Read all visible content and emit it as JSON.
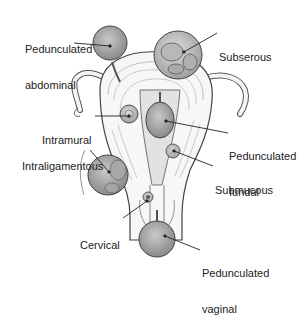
{
  "diagram": {
    "labels": [
      {
        "id": "pedunculated_abdominal",
        "lines": [
          "Pedunculated",
          "abdominal"
        ],
        "x": 25,
        "y": 19
      },
      {
        "id": "subserous",
        "lines": [
          "Subserous"
        ],
        "x": 219,
        "y": 27
      },
      {
        "id": "intramural",
        "lines": [
          "Intramural"
        ],
        "x": 42,
        "y": 111
      },
      {
        "id": "pedunculated_fundal",
        "lines": [
          "Pedunculated",
          "fundal"
        ],
        "x": 229,
        "y": 126
      },
      {
        "id": "intraligamentous",
        "lines": [
          "Intraligamentous"
        ],
        "x": 22,
        "y": 137
      },
      {
        "id": "submucous",
        "lines": [
          "Submucous"
        ],
        "x": 215,
        "y": 160
      },
      {
        "id": "cervical",
        "lines": [
          "Cervical"
        ],
        "x": 80,
        "y": 215
      },
      {
        "id": "pedunculated_vaginal",
        "lines": [
          "Pedunculated",
          "vaginal"
        ],
        "x": 202,
        "y": 243
      }
    ],
    "colors": {
      "ink": "#222222",
      "tissue": "#f4f4f4",
      "fibroid": "#9a9a9a",
      "fibroid_light": "#c4c4c4",
      "line": "#333333"
    }
  }
}
